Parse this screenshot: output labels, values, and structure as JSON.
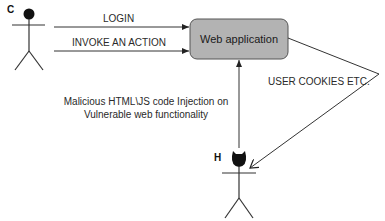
{
  "actors": {
    "client": {
      "label": "C"
    },
    "hacker": {
      "label": "H"
    }
  },
  "nodes": {
    "web_app": {
      "label": "Web application",
      "fill": "#b3b3b3",
      "stroke": "#555555"
    }
  },
  "edges": {
    "login": {
      "label": "LOGIN",
      "from": "C",
      "to": "Web application"
    },
    "invoke": {
      "label": "INVOKE AN ACTION",
      "from": "C",
      "to": "Web application"
    },
    "injection": {
      "label_line1": "Malicious HTML\\JS code Injection on",
      "label_line2": "Vulnerable web functionality",
      "from": "H",
      "to": "Web application"
    },
    "cookies": {
      "label": "USER COOKIES ETC.",
      "from": "Web application",
      "to": "H"
    }
  },
  "colors": {
    "line": "#333333",
    "head": "#111111"
  }
}
